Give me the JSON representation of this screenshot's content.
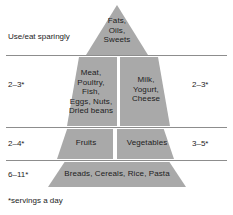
{
  "figure": {
    "fill_color": "#a9a9a9",
    "rule_color": "#8d8d8d",
    "text_color": "#1c1c1c",
    "background": "#ffffff"
  },
  "tiers": {
    "apex": {
      "food_label": "Fats,\nOils,\nSweets",
      "left_note": "Use/eat sparingly"
    },
    "tier2": {
      "left_food_label": "Meat,\nPoultry,\nFish,\nEggs, Nuts,\nDried beans",
      "right_food_label": "Milk,\nYogurt,\nCheese",
      "left_servings": "2–3*",
      "right_servings": "2–3*"
    },
    "tier3": {
      "left_food_label": "Fruits",
      "right_food_label": "Vegetables",
      "left_servings": "2–4*",
      "right_servings": "3–5*"
    },
    "base": {
      "food_label": "Breads, Cereals, Rice, Pasta",
      "left_servings": "6–11*"
    }
  },
  "footnote": "*servings a day"
}
